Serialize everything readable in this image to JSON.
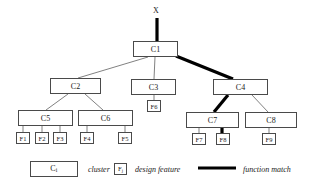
{
  "diagram": {
    "root": {
      "label": "X"
    },
    "clusters": [
      {
        "id": "C1",
        "label": "C1",
        "x": 133,
        "y": 41,
        "w": 45,
        "h": 16
      },
      {
        "id": "C2",
        "label": "C2",
        "x": 50,
        "y": 78,
        "w": 51,
        "h": 16
      },
      {
        "id": "C3",
        "label": "C3",
        "x": 131,
        "y": 79,
        "w": 45,
        "h": 16
      },
      {
        "id": "C4",
        "label": "C4",
        "x": 213,
        "y": 79,
        "w": 55,
        "h": 16
      },
      {
        "id": "C5",
        "label": "C5",
        "x": 18,
        "y": 110,
        "w": 55,
        "h": 16
      },
      {
        "id": "C6",
        "label": "C6",
        "x": 78,
        "y": 110,
        "w": 55,
        "h": 16
      },
      {
        "id": "C7",
        "label": "C7",
        "x": 186,
        "y": 112,
        "w": 53,
        "h": 16
      },
      {
        "id": "C8",
        "label": "C8",
        "x": 245,
        "y": 112,
        "w": 52,
        "h": 16
      }
    ],
    "features": [
      {
        "id": "F1",
        "label": "F1",
        "x": 16,
        "y": 132,
        "w": 14,
        "h": 12
      },
      {
        "id": "F2",
        "label": "F2",
        "x": 35,
        "y": 132,
        "w": 14,
        "h": 12
      },
      {
        "id": "F3",
        "label": "F3",
        "x": 53,
        "y": 132,
        "w": 14,
        "h": 12
      },
      {
        "id": "F4",
        "label": "F4",
        "x": 80,
        "y": 132,
        "w": 14,
        "h": 12
      },
      {
        "id": "F5",
        "label": "F5",
        "x": 118,
        "y": 132,
        "w": 14,
        "h": 12
      },
      {
        "id": "F6",
        "label": "F6",
        "x": 147,
        "y": 100,
        "w": 14,
        "h": 12
      },
      {
        "id": "F7",
        "label": "F7",
        "x": 192,
        "y": 133,
        "w": 14,
        "h": 12
      },
      {
        "id": "F8",
        "label": "F8",
        "x": 216,
        "y": 133,
        "w": 14,
        "h": 12
      },
      {
        "id": "F9",
        "label": "F9",
        "x": 262,
        "y": 133,
        "w": 14,
        "h": 12
      }
    ],
    "thin_edges": [
      {
        "from": "C1",
        "to": "C2",
        "x1": 148,
        "y1": 57,
        "x2": 78,
        "y2": 78
      },
      {
        "from": "C1",
        "to": "C3",
        "x1": 155,
        "y1": 57,
        "x2": 154,
        "y2": 79
      },
      {
        "from": "C2",
        "to": "C5",
        "x1": 68,
        "y1": 94,
        "x2": 46,
        "y2": 110
      },
      {
        "from": "C2",
        "to": "C6",
        "x1": 85,
        "y1": 94,
        "x2": 103,
        "y2": 110
      },
      {
        "from": "C3",
        "to": "F6",
        "x1": 154,
        "y1": 95,
        "x2": 154,
        "y2": 100
      },
      {
        "from": "C4",
        "to": "C8",
        "x1": 252,
        "y1": 95,
        "x2": 268,
        "y2": 112
      },
      {
        "from": "C5",
        "to": "F1",
        "x1": 23,
        "y1": 126,
        "x2": 23,
        "y2": 132
      },
      {
        "from": "C5",
        "to": "F2",
        "x1": 42,
        "y1": 126,
        "x2": 42,
        "y2": 132
      },
      {
        "from": "C5",
        "to": "F3",
        "x1": 60,
        "y1": 126,
        "x2": 60,
        "y2": 132
      },
      {
        "from": "C6",
        "to": "F4",
        "x1": 87,
        "y1": 126,
        "x2": 87,
        "y2": 132
      },
      {
        "from": "C6",
        "to": "F5",
        "x1": 125,
        "y1": 126,
        "x2": 125,
        "y2": 132
      },
      {
        "from": "C7",
        "to": "F7",
        "x1": 199,
        "y1": 128,
        "x2": 199,
        "y2": 133
      },
      {
        "from": "C8",
        "to": "F9",
        "x1": 269,
        "y1": 128,
        "x2": 269,
        "y2": 133
      }
    ],
    "function_match_path": [
      {
        "from": "X",
        "to": "C1",
        "x1": 157,
        "y1": 18,
        "x2": 157,
        "y2": 41
      },
      {
        "from": "C1",
        "to": "C4",
        "x1": 176,
        "y1": 56,
        "x2": 233,
        "y2": 79
      },
      {
        "from": "C4",
        "to": "C7",
        "x1": 228,
        "y1": 95,
        "x2": 214,
        "y2": 112
      },
      {
        "from": "C7",
        "to": "F8",
        "x1": 222,
        "y1": 128,
        "x2": 222,
        "y2": 133
      }
    ]
  },
  "legend": {
    "items": [
      {
        "key": "cluster",
        "symbol_kind": "cluster-box",
        "symbol_base": "C",
        "symbol_sub": "i",
        "label": "cluster"
      },
      {
        "key": "design-feature",
        "symbol_kind": "feature-box",
        "symbol_base": "F",
        "symbol_sub": "j",
        "label": "design feature"
      },
      {
        "key": "function-match",
        "symbol_kind": "thick-line",
        "label": "function match"
      }
    ]
  },
  "style": {
    "line_color": "#4a4a4a",
    "thick_line_color": "#000000",
    "text_color": "#1a1a1a",
    "background": "#ffffff",
    "thin_width": 0.7,
    "thick_width": 3.2
  }
}
